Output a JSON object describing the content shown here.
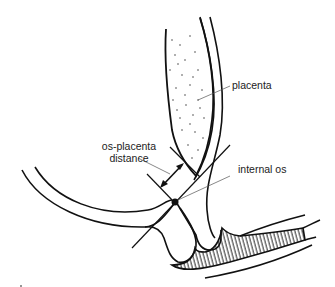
{
  "diagram": {
    "type": "anatomical line drawing",
    "labels": {
      "placenta": "placenta",
      "os_placenta_line1": "os-placenta",
      "os_placenta_line2": "distance",
      "internal_os": "internal os"
    },
    "colors": {
      "stroke": "#111111",
      "leader": "#555555",
      "background": "#ffffff"
    }
  }
}
